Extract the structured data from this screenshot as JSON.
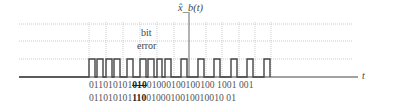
{
  "diagram": {
    "signal_label": "x̂_b(t)",
    "axis_label": "t",
    "annotation_line1": "bit",
    "annotation_line2": "error",
    "received_bits": {
      "before": "011010101",
      "error_segment": "010",
      "after": "01000100100100 1001 001"
    },
    "received_bits_display": "0110101010100100010010010 01001 001",
    "transmitted_bits": {
      "before": "011010101",
      "error_segment": "110",
      "after": "0100010010010010 01"
    }
  },
  "colors": {
    "waveform": "#444444",
    "gridline": "#bbbbbb",
    "text": "#555555"
  }
}
